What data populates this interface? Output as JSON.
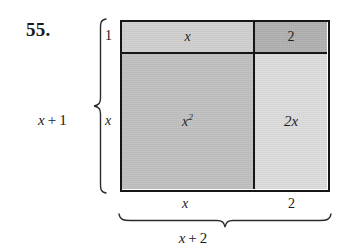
{
  "exercise": {
    "number_label": "55."
  },
  "area_model": {
    "cells": [
      {
        "id": "top-left",
        "label": "x",
        "exponent": "",
        "fill": "#d2d2d2"
      },
      {
        "id": "top-right",
        "label": "2",
        "exponent": "",
        "fill": "#b2b2b2"
      },
      {
        "id": "bottom-left",
        "label": "x",
        "exponent": "2",
        "fill": "#c2c2c2"
      },
      {
        "id": "bottom-right",
        "label": "2x",
        "exponent": "",
        "fill": "#dedede"
      }
    ]
  },
  "left_dimension": {
    "outer_label": {
      "variable": "x",
      "operator": "+",
      "number": "1"
    },
    "segments": [
      {
        "id": "top",
        "label": "1"
      },
      {
        "id": "bottom",
        "label": "x"
      }
    ]
  },
  "bottom_dimension": {
    "outer_label": {
      "variable": "x",
      "operator": "+",
      "number": "2"
    },
    "segments": [
      {
        "id": "left",
        "label": "x"
      },
      {
        "id": "right",
        "label": "2"
      }
    ]
  },
  "colors": {
    "ink": "#161616",
    "page_background": "#ffffff"
  }
}
